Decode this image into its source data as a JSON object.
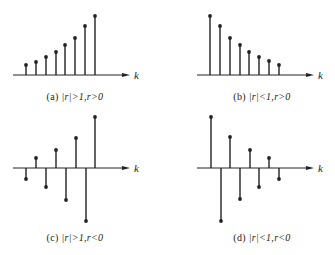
{
  "figure": {
    "panels": [
      {
        "id": "a",
        "label": "(a)",
        "condition": "|r|>1,r>0",
        "axis_label": "k",
        "axis_y": 75,
        "axis_x0": 13,
        "axis_x1": 130,
        "k_pos": [
          134,
          69
        ],
        "caption_pos": [
          75,
          91
        ],
        "stems": [
          [
            26,
            65
          ],
          [
            36,
            62
          ],
          [
            46,
            57
          ],
          [
            56,
            52
          ],
          [
            65,
            45
          ],
          [
            75,
            38
          ],
          [
            85,
            26
          ],
          [
            95,
            16
          ]
        ]
      },
      {
        "id": "b",
        "label": "(b)",
        "condition": "|r|<1,r>0",
        "axis_label": "k",
        "axis_y": 75,
        "axis_x0": 197,
        "axis_x1": 314,
        "k_pos": [
          318,
          69
        ],
        "caption_pos": [
          262,
          91
        ],
        "stems": [
          [
            210,
            16
          ],
          [
            220,
            26
          ],
          [
            230,
            38
          ],
          [
            240,
            45
          ],
          [
            249,
            52
          ],
          [
            259,
            57
          ],
          [
            269,
            61
          ],
          [
            279,
            65
          ]
        ]
      },
      {
        "id": "c",
        "label": "(c)",
        "condition": "|r|>1,r<0",
        "axis_label": "k",
        "axis_y": 168,
        "axis_x0": 13,
        "axis_x1": 130,
        "k_pos": [
          134,
          162
        ],
        "caption_pos": [
          75,
          232
        ],
        "stems": [
          [
            26,
            179
          ],
          [
            36,
            158
          ],
          [
            46,
            187
          ],
          [
            56,
            150
          ],
          [
            66,
            200
          ],
          [
            76,
            138
          ],
          [
            86,
            221
          ],
          [
            95,
            117
          ]
        ]
      },
      {
        "id": "d",
        "label": "(d)",
        "condition": "|r|<1,r<0",
        "axis_label": "k",
        "axis_y": 168,
        "axis_x0": 197,
        "axis_x1": 314,
        "k_pos": [
          318,
          162
        ],
        "caption_pos": [
          262,
          232
        ],
        "stems": [
          [
            211,
            117
          ],
          [
            221,
            221
          ],
          [
            230,
            137
          ],
          [
            240,
            199
          ],
          [
            250,
            150
          ],
          [
            259,
            187
          ],
          [
            269,
            158
          ],
          [
            279,
            179
          ]
        ]
      }
    ],
    "colors": {
      "ink": "#222222",
      "background": "#ffffff"
    }
  }
}
